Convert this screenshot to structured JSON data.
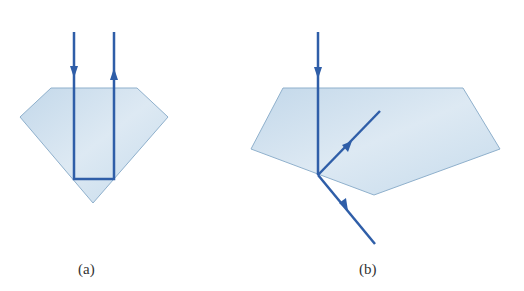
{
  "colors": {
    "ray": "#2f5ea8",
    "prism_fill": "#cfe1ef",
    "prism_stroke": "#8fb0cc"
  },
  "figures": [
    {
      "id": "a",
      "caption": "(a)",
      "shape": "diamond",
      "description": "Light enters top face, totally internally reflects twice, and exits back upward"
    },
    {
      "id": "b",
      "caption": "(b)",
      "shape": "pentagon",
      "description": "Light enters top face, at lower face partially reflects and partially refracts out"
    }
  ]
}
